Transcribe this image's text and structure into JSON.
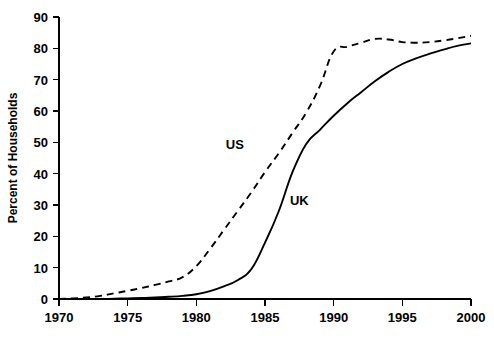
{
  "chart_data": {
    "type": "line",
    "title": "",
    "xlabel": "",
    "ylabel": "Percent of Households",
    "xlim": [
      1970,
      2000
    ],
    "ylim": [
      0,
      90
    ],
    "xticks": [
      1970,
      1975,
      1980,
      1985,
      1990,
      1995,
      2000
    ],
    "yticks": [
      0,
      10,
      20,
      30,
      40,
      50,
      60,
      70,
      80,
      90
    ],
    "xtick_labels": [
      "1970",
      "1975",
      "1980",
      "1985",
      "1990",
      "1995",
      "2000"
    ],
    "ytick_labels": [
      "0",
      "10",
      "20",
      "30",
      "40",
      "50",
      "60",
      "70",
      "80",
      "90"
    ],
    "grid": false,
    "legend_position": "inline-annotations",
    "series": [
      {
        "name": "US",
        "style": "dashed",
        "color": "#000000",
        "label_x": 1982.8,
        "label_y": 48,
        "x": [
          1970,
          1971,
          1972,
          1973,
          1974,
          1975,
          1976,
          1977,
          1978,
          1979,
          1980,
          1981,
          1982,
          1983,
          1984,
          1985,
          1986,
          1987,
          1988,
          1989,
          1990,
          1991,
          1992,
          1993,
          1994,
          1995,
          1996,
          1997,
          1998,
          1999,
          2000
        ],
        "y": [
          0,
          0.2,
          0.5,
          1.0,
          1.8,
          2.6,
          3.5,
          4.5,
          5.6,
          7.0,
          10.5,
          16.0,
          22.0,
          28.0,
          34.0,
          40.5,
          46.5,
          53.0,
          59.5,
          68.0,
          79.0,
          80.5,
          81.8,
          83.0,
          82.8,
          82.0,
          81.8,
          82.0,
          82.5,
          83.2,
          84.0
        ]
      },
      {
        "name": "UK",
        "style": "solid",
        "color": "#000000",
        "label_x": 1987.5,
        "label_y": 30,
        "x": [
          1970,
          1971,
          1972,
          1973,
          1974,
          1975,
          1976,
          1977,
          1978,
          1979,
          1980,
          1981,
          1982,
          1983,
          1984,
          1985,
          1986,
          1987,
          1988,
          1989,
          1990,
          1991,
          1992,
          1993,
          1994,
          1995,
          1996,
          1997,
          1998,
          1999,
          2000
        ],
        "y": [
          0,
          0,
          0,
          0,
          0.1,
          0.2,
          0.3,
          0.5,
          0.7,
          1.0,
          1.5,
          2.5,
          4.0,
          6.0,
          9.5,
          18.0,
          28.0,
          40.5,
          49.5,
          54.0,
          58.5,
          62.5,
          66.0,
          69.5,
          72.5,
          75.0,
          76.8,
          78.3,
          79.6,
          80.8,
          81.6
        ]
      }
    ],
    "annotations": [
      {
        "text": "US",
        "x": 1982.8,
        "y": 48
      },
      {
        "text": "UK",
        "x": 1987.5,
        "y": 30
      }
    ]
  }
}
